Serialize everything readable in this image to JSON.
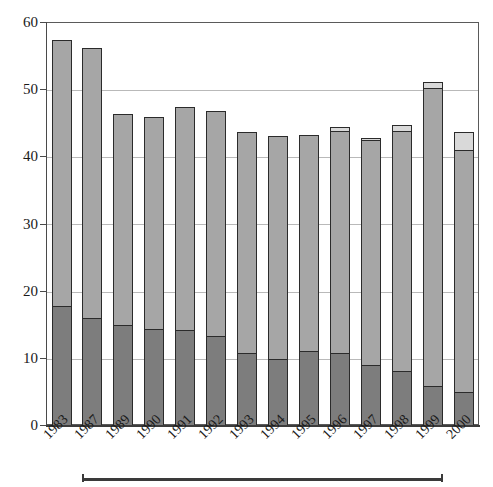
{
  "chart_data": {
    "type": "bar",
    "title": "",
    "subtitle": "",
    "xlabel": "",
    "ylabel": "",
    "stacked": true,
    "grid": true,
    "legend_position": "none",
    "ylim": [
      0,
      60
    ],
    "yticks": [
      0,
      10,
      20,
      30,
      40,
      50,
      60
    ],
    "ytick_labels": [
      "0",
      "10",
      "20",
      "30",
      "40",
      "50",
      "60"
    ],
    "categories": [
      "1983",
      "1987",
      "1989",
      "1990",
      "1991",
      "1992",
      "1993",
      "1994",
      "1995",
      "1996",
      "1997",
      "1998",
      "1999",
      "2000"
    ],
    "series": [
      {
        "name": "lower-segment",
        "color": "#7d7d7d",
        "values": [
          17.7,
          16.0,
          14.9,
          14.3,
          14.1,
          13.2,
          10.8,
          9.9,
          11.0,
          10.7,
          8.9,
          8.1,
          5.8,
          4.9
        ]
      },
      {
        "name": "middle-segment",
        "color": "#a6a6a6",
        "values": [
          39.6,
          40.2,
          31.4,
          31.5,
          33.3,
          33.6,
          32.9,
          33.2,
          32.2,
          33.1,
          33.6,
          35.7,
          44.4,
          36.1
        ]
      },
      {
        "name": "upper-segment",
        "color": "#d9d9d9",
        "values": [
          0.0,
          0.0,
          0.0,
          0.0,
          0.0,
          0.0,
          0.0,
          0.0,
          0.0,
          0.5,
          0.3,
          0.8,
          0.8,
          2.7
        ]
      }
    ],
    "totals": [
      57.3,
      56.2,
      46.3,
      45.8,
      47.4,
      46.8,
      43.7,
      43.1,
      43.2,
      44.3,
      42.8,
      44.6,
      51.0,
      43.7
    ],
    "bracket": {
      "label": "",
      "from_category": "1987",
      "to_category": "1999"
    }
  }
}
